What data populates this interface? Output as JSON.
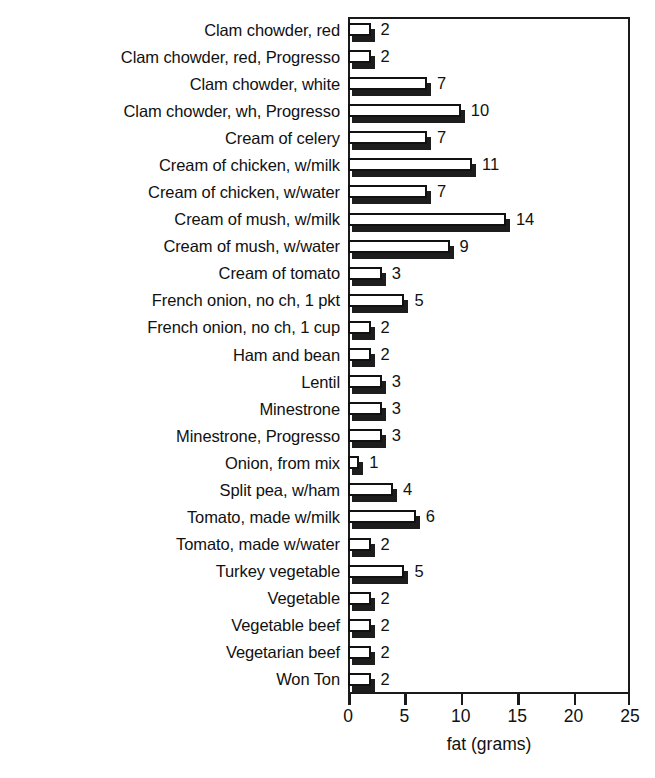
{
  "chart_data": {
    "type": "bar",
    "orientation": "horizontal",
    "title": "",
    "xlabel": "fat (grams)",
    "ylabel": "",
    "xlim": [
      0,
      25
    ],
    "xticks": [
      0,
      5,
      10,
      15,
      20,
      25
    ],
    "xtick_labels": [
      "0",
      "5",
      "10",
      "15",
      "20",
      "25"
    ],
    "grid": false,
    "legend": null,
    "show_value_labels": true,
    "categories": [
      "Clam chowder, red",
      "Clam chowder, red, Progresso",
      "Clam chowder, white",
      "Clam chowder, wh, Progresso",
      "Cream of celery",
      "Cream of chicken, w/milk",
      "Cream of chicken, w/water",
      "Cream of mush, w/milk",
      "Cream of mush, w/water",
      "Cream of tomato",
      "French onion, no ch, 1 pkt",
      "French onion, no ch, 1 cup",
      "Ham and bean",
      "Lentil",
      "Minestrone",
      "Minestrone, Progresso",
      "Onion, from mix",
      "Split pea, w/ham",
      "Tomato, made w/milk",
      "Tomato, made w/water",
      "Turkey vegetable",
      "Vegetable",
      "Vegetable beef",
      "Vegetarian beef",
      "Won Ton"
    ],
    "values": [
      2,
      2,
      7,
      10,
      7,
      11,
      7,
      14,
      9,
      3,
      5,
      2,
      2,
      3,
      3,
      3,
      1,
      4,
      6,
      2,
      5,
      2,
      2,
      2,
      2
    ],
    "value_labels": [
      "2",
      "2",
      "7",
      "10",
      "7",
      "11",
      "7",
      "14",
      "9",
      "3",
      "5",
      "2",
      "2",
      "3",
      "3",
      "3",
      "1",
      "4",
      "6",
      "2",
      "5",
      "2",
      "2",
      "2",
      "2"
    ],
    "colors": {
      "bar_face": "#ffffff",
      "bar_outline": "#111111",
      "bar_shadow": "#1d1d1d",
      "axis": "#1a1a1a",
      "text": "#111111",
      "background": "#ffffff"
    }
  },
  "top_artifact": "",
  "axis": {
    "x_title": "fat (grams)"
  }
}
